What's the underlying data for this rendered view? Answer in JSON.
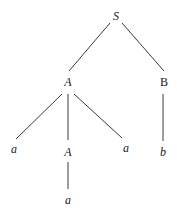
{
  "diagram": {
    "type": "parse-tree",
    "nodes": [
      {
        "id": "S",
        "label": "S",
        "italic": true,
        "x": 116,
        "y": 16
      },
      {
        "id": "A1",
        "label": "A",
        "italic": true,
        "x": 68,
        "y": 82
      },
      {
        "id": "B",
        "label": "B",
        "italic": false,
        "x": 164,
        "y": 82
      },
      {
        "id": "a1",
        "label": "a",
        "italic": true,
        "x": 14,
        "y": 149
      },
      {
        "id": "A2",
        "label": "A",
        "italic": true,
        "x": 68,
        "y": 152
      },
      {
        "id": "a2",
        "label": "a",
        "italic": true,
        "x": 126,
        "y": 148
      },
      {
        "id": "b",
        "label": "b",
        "italic": true,
        "x": 163,
        "y": 152
      },
      {
        "id": "a3",
        "label": "a",
        "italic": true,
        "x": 68,
        "y": 200
      }
    ],
    "edges": [
      {
        "from": "S",
        "to": "A1",
        "x1": 110,
        "y1": 23,
        "x2": 69,
        "y2": 71
      },
      {
        "from": "S",
        "to": "B",
        "x1": 122,
        "y1": 23,
        "x2": 164,
        "y2": 71
      },
      {
        "from": "A1",
        "to": "a1",
        "x1": 62,
        "y1": 94,
        "x2": 16,
        "y2": 139
      },
      {
        "from": "A1",
        "to": "A2",
        "x1": 68,
        "y1": 94,
        "x2": 68,
        "y2": 140
      },
      {
        "from": "A1",
        "to": "a2",
        "x1": 74,
        "y1": 94,
        "x2": 122,
        "y2": 138
      },
      {
        "from": "B",
        "to": "b",
        "x1": 163,
        "y1": 94,
        "x2": 163,
        "y2": 141
      },
      {
        "from": "A2",
        "to": "a3",
        "x1": 68,
        "y1": 162,
        "x2": 68,
        "y2": 189
      }
    ]
  },
  "colors": {
    "edge": "#3a3a3a",
    "text": "#222222",
    "background": "#ffffff"
  }
}
